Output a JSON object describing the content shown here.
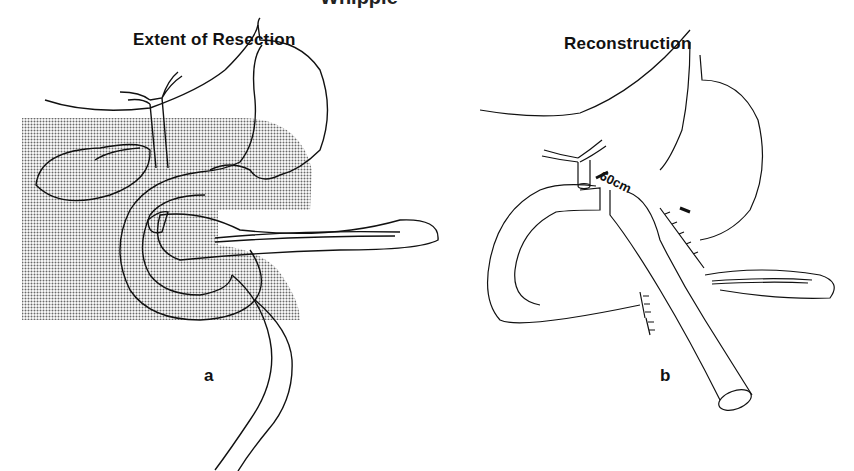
{
  "figure": {
    "top_title_partial": "Whipple",
    "panels": [
      {
        "id": "a",
        "title": "Extent of Resection",
        "label": "a",
        "shading_color": "#9a9a9a"
      },
      {
        "id": "b",
        "title": "Reconstruction",
        "label": "b",
        "annotation": "60cm"
      }
    ]
  }
}
